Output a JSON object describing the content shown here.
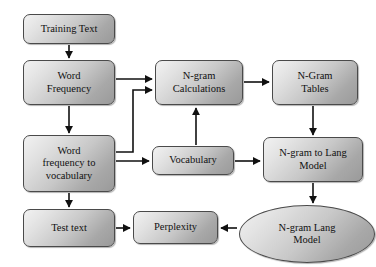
{
  "diagram": {
    "type": "flowchart",
    "background_color": "#ffffff",
    "node_fill_light": "#f2f2f2",
    "node_fill_dark": "#9a9a9a",
    "node_border_color": "#4a4a4a",
    "text_color": "#111111",
    "arrow_color": "#111111",
    "nodes": [
      {
        "id": "training_text",
        "label": "Training Text",
        "shape": "rounded-rect",
        "x": 23,
        "y": 14,
        "w": 92,
        "h": 30
      },
      {
        "id": "word_frequency",
        "label": "Word\nFrequency",
        "shape": "rounded-rect",
        "x": 23,
        "y": 60,
        "w": 92,
        "h": 45
      },
      {
        "id": "word_freq_vocab",
        "label": "Word\nfrequency to\nvocabulary",
        "shape": "rounded-rect",
        "x": 23,
        "y": 135,
        "w": 92,
        "h": 57
      },
      {
        "id": "test_text",
        "label": "Test text",
        "shape": "rounded-rect",
        "x": 23,
        "y": 209,
        "w": 92,
        "h": 38
      },
      {
        "id": "ngram_calc",
        "label": "N-gram\nCalculations",
        "shape": "rounded-rect",
        "x": 155,
        "y": 60,
        "w": 88,
        "h": 45
      },
      {
        "id": "vocabulary",
        "label": "Vocabulary",
        "shape": "rounded-rect",
        "x": 152,
        "y": 146,
        "w": 82,
        "h": 29
      },
      {
        "id": "perplexity",
        "label": "Perplexity",
        "shape": "rounded-rect",
        "x": 133,
        "y": 211,
        "w": 85,
        "h": 33
      },
      {
        "id": "ngram_tables",
        "label": "N-Gram\nTables",
        "shape": "rounded-rect",
        "x": 272,
        "y": 60,
        "w": 86,
        "h": 45
      },
      {
        "id": "ngram_to_lang",
        "label": "N-gram to Lang\nModel",
        "shape": "rounded-rect",
        "x": 263,
        "y": 137,
        "w": 100,
        "h": 45
      },
      {
        "id": "ngram_lang_model",
        "label": "N-gram Lang\nModel",
        "shape": "ellipse",
        "x": 239,
        "y": 205,
        "w": 136,
        "h": 58
      }
    ],
    "edges": [
      {
        "from": "training_text",
        "to": "word_frequency",
        "style": "straight-vertical"
      },
      {
        "from": "word_frequency",
        "to": "word_freq_vocab",
        "style": "straight-vertical"
      },
      {
        "from": "word_frequency",
        "to": "ngram_calc",
        "style": "straight-horizontal"
      },
      {
        "from": "word_freq_vocab",
        "to": "ngram_calc",
        "style": "elbow"
      },
      {
        "from": "word_freq_vocab",
        "to": "vocabulary",
        "style": "straight-horizontal"
      },
      {
        "from": "word_freq_vocab",
        "to": "test_text",
        "style": "straight-vertical"
      },
      {
        "from": "vocabulary",
        "to": "ngram_calc",
        "style": "straight-vertical"
      },
      {
        "from": "vocabulary",
        "to": "ngram_to_lang",
        "style": "straight-horizontal"
      },
      {
        "from": "ngram_calc",
        "to": "ngram_tables",
        "style": "straight-horizontal"
      },
      {
        "from": "ngram_tables",
        "to": "ngram_to_lang",
        "style": "straight-vertical"
      },
      {
        "from": "ngram_to_lang",
        "to": "ngram_lang_model",
        "style": "straight-vertical"
      },
      {
        "from": "ngram_lang_model",
        "to": "perplexity",
        "style": "straight-horizontal-left"
      },
      {
        "from": "test_text",
        "to": "perplexity",
        "style": "straight-horizontal"
      }
    ]
  }
}
